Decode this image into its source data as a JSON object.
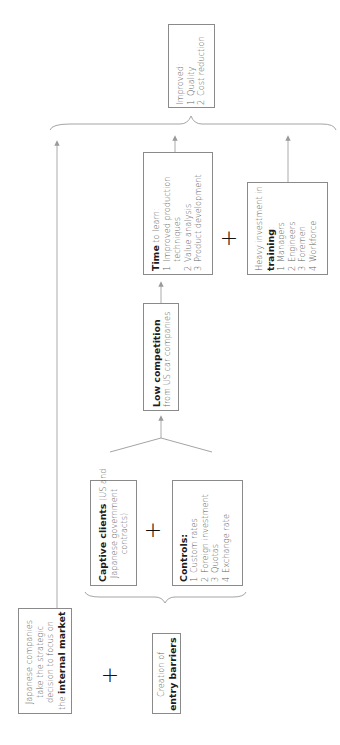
{
  "diagram": {
    "orientation": "rotated-90-ccw",
    "accent_colors": {
      "line": "#9a9a9a",
      "box_border": "#8a8a8a",
      "bold_text": "#1c1c1c",
      "body_text": "#606060"
    },
    "start_node": {
      "line1": "Japanese companies",
      "line2": "take the strategic",
      "line3": "decision to focus on",
      "line4_prefix": "the ",
      "line4_bold": "internal market"
    },
    "plus_1": "+",
    "entry_barriers": {
      "line1": "Creation of",
      "line2_bold": "entry barriers"
    },
    "captive_clients": {
      "bold": "Captive clients",
      "rest1": " (US and",
      "line2": "Japanese government",
      "line3": "contracts)"
    },
    "plus_2": "+",
    "controls": {
      "title": "Controls:",
      "items": [
        {
          "n": "1",
          "label": "Custom rates"
        },
        {
          "n": "2",
          "label": "Foreign investment"
        },
        {
          "n": "3",
          "label": "Quotas"
        },
        {
          "n": "4",
          "label": "Exchange rate"
        }
      ]
    },
    "low_competition": {
      "bold": "Low competition",
      "line2": "from US car companies"
    },
    "time_to_learn": {
      "bold": "Time",
      "rest": " to learn:",
      "items": [
        {
          "n": "1",
          "label": "Improved production",
          "cont": "techniques"
        },
        {
          "n": "2",
          "label": "Value analysis"
        },
        {
          "n": "3",
          "label": "Product development"
        }
      ]
    },
    "plus_3": "+",
    "training": {
      "line1": "Heavy investment in",
      "bold": "training",
      "colon": ":",
      "items": [
        {
          "n": "1",
          "label": "Managers"
        },
        {
          "n": "2",
          "label": "Engineers"
        },
        {
          "n": "3",
          "label": "Foremen"
        },
        {
          "n": "4",
          "label": "Workforce"
        }
      ]
    },
    "outcome": {
      "title": "Improved:",
      "items": [
        {
          "n": "1",
          "label": "Quality"
        },
        {
          "n": "2",
          "label": "Cost reduction"
        }
      ]
    }
  }
}
